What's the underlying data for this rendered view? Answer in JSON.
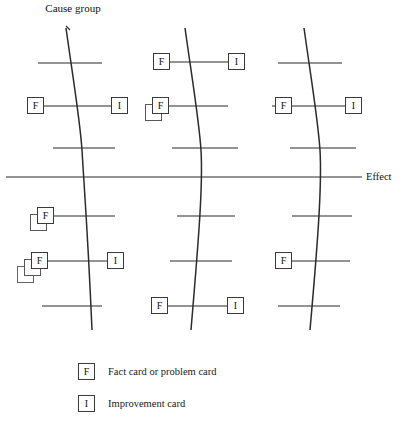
{
  "diagram": {
    "type": "fishbone-ishikawa",
    "title_label": "Cause group",
    "effect_label": "Effect",
    "card_codes": {
      "fact": "F",
      "improvement": "I"
    },
    "spines": [
      {
        "name": "cause-group-left",
        "x_top": 72,
        "x_bottom": 96
      },
      {
        "name": "cause-group-middle",
        "x_top": 188,
        "x_bottom": 212
      },
      {
        "name": "cause-group-right",
        "x_top": 302,
        "x_bottom": 326
      }
    ],
    "ribs": [
      {
        "spine": "left",
        "y": 63,
        "x_start": 38,
        "x_end": 102
      },
      {
        "spine": "left",
        "y": 106,
        "x_start": 36,
        "x_end": 112
      },
      {
        "spine": "left",
        "y": 148,
        "x_start": 53,
        "x_end": 115
      },
      {
        "spine": "left",
        "y": 216,
        "x_start": 46,
        "x_end": 115
      },
      {
        "spine": "left",
        "y": 261,
        "x_start": 40,
        "x_end": 123
      },
      {
        "spine": "left",
        "y": 306,
        "x_start": 42,
        "x_end": 102
      },
      {
        "spine": "middle",
        "y": 62,
        "x_start": 155,
        "x_end": 232
      },
      {
        "spine": "middle",
        "y": 106,
        "x_start": 152,
        "x_end": 228
      },
      {
        "spine": "middle",
        "y": 148,
        "x_start": 172,
        "x_end": 238
      },
      {
        "spine": "middle",
        "y": 216,
        "x_start": 177,
        "x_end": 235
      },
      {
        "spine": "middle",
        "y": 261,
        "x_start": 170,
        "x_end": 232
      },
      {
        "spine": "middle",
        "y": 306,
        "x_start": 157,
        "x_end": 231
      },
      {
        "spine": "right",
        "y": 63,
        "x_start": 278,
        "x_end": 342
      },
      {
        "spine": "right",
        "y": 106,
        "x_start": 272,
        "x_end": 348
      },
      {
        "spine": "right",
        "y": 148,
        "x_start": 290,
        "x_end": 356
      },
      {
        "spine": "right",
        "y": 216,
        "x_start": 292,
        "x_end": 352
      },
      {
        "spine": "right",
        "y": 261,
        "x_start": 276,
        "x_end": 350
      },
      {
        "spine": "right",
        "y": 306,
        "x_start": 278,
        "x_end": 340
      }
    ],
    "spine_main": {
      "y": 177,
      "x_start": 6,
      "x_end": 362
    },
    "cards": [
      {
        "name": "card-left-upper-fact",
        "code": "F",
        "x": 27,
        "y": 97,
        "stack": 1
      },
      {
        "name": "card-left-upper-improvement",
        "code": "I",
        "x": 111,
        "y": 97,
        "stack": 1
      },
      {
        "name": "card-left-mid-fact",
        "code": "F",
        "x": 37,
        "y": 207,
        "stack": 2
      },
      {
        "name": "card-left-lower-fact",
        "code": "F",
        "x": 31,
        "y": 252,
        "stack": 3
      },
      {
        "name": "card-left-lower-improvement",
        "code": "I",
        "x": 107,
        "y": 252,
        "stack": 1
      },
      {
        "name": "card-middle-top-fact",
        "code": "F",
        "x": 153,
        "y": 53,
        "stack": 1
      },
      {
        "name": "card-middle-top-improvement",
        "code": "I",
        "x": 228,
        "y": 53,
        "stack": 1
      },
      {
        "name": "card-middle-upper-fact",
        "code": "F",
        "x": 152,
        "y": 97,
        "stack": 2
      },
      {
        "name": "card-middle-bottom-fact",
        "code": "F",
        "x": 151,
        "y": 297,
        "stack": 1
      },
      {
        "name": "card-middle-bottom-improvement",
        "code": "I",
        "x": 227,
        "y": 297,
        "stack": 1
      },
      {
        "name": "card-right-upper-fact",
        "code": "F",
        "x": 275,
        "y": 97,
        "stack": 1
      },
      {
        "name": "card-right-upper-improvement",
        "code": "I",
        "x": 345,
        "y": 97,
        "stack": 1
      },
      {
        "name": "card-right-lower-fact",
        "code": "F",
        "x": 275,
        "y": 252,
        "stack": 1
      }
    ]
  },
  "legend": {
    "items": [
      {
        "code": "F",
        "description": "Fact card or problem card"
      },
      {
        "code": "I",
        "description": "Improvement card"
      }
    ]
  },
  "colors": {
    "background": "#ffffff",
    "line": "#2b2b2b",
    "card_border": "#3a3a3a",
    "text": "#111111"
  }
}
